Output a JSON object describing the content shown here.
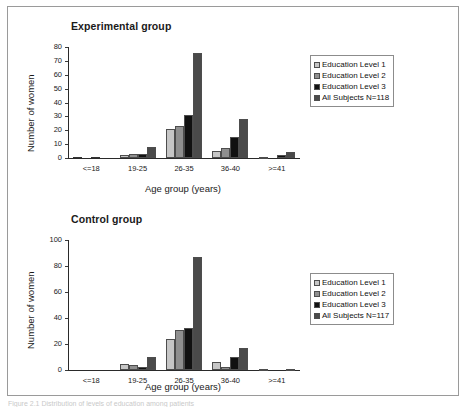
{
  "figure": {
    "caption": "Figure 2.1 Distribution of levels of education among patients"
  },
  "legend_items": [
    {
      "label": "Education Level 1",
      "color": "#c6c6c6"
    },
    {
      "label": "Education Level 2",
      "color": "#8f8f8f"
    },
    {
      "label": "Education Level 3",
      "color": "#111111"
    },
    {
      "label_exp": "All Subjects N=118",
      "label_ctl": "All Subjects N=117",
      "color": "#4a4a4a"
    }
  ],
  "chart_data": [
    {
      "type": "bar",
      "title": "Experimental group",
      "xlabel": "Age group (years)",
      "ylabel": "Number of women",
      "categories": [
        "<=18",
        "19-25",
        "26-35",
        "36-40",
        ">=41"
      ],
      "ylim": [
        0,
        80
      ],
      "yticks": [
        0,
        10,
        20,
        30,
        40,
        50,
        60,
        70,
        80
      ],
      "grid": false,
      "legend_position": "right",
      "series": [
        {
          "name": "Education Level 1",
          "color": "#c6c6c6",
          "values": [
            0,
            2,
            21,
            5,
            1
          ]
        },
        {
          "name": "Education Level 2",
          "color": "#8f8f8f",
          "values": [
            0,
            3,
            23,
            7,
            0
          ]
        },
        {
          "name": "Education Level 3",
          "color": "#111111",
          "values": [
            0,
            3,
            31,
            15,
            2
          ]
        },
        {
          "name": "All Subjects N=118",
          "color": "#4a4a4a",
          "values": [
            0,
            8,
            76,
            28,
            4
          ]
        }
      ]
    },
    {
      "type": "bar",
      "title": "Control group",
      "xlabel": "Age group (years)",
      "ylabel": "Number of women",
      "categories": [
        "<=18",
        "19-25",
        "26-35",
        "36-40",
        ">=41"
      ],
      "ylim": [
        0,
        100
      ],
      "yticks": [
        0,
        20,
        40,
        60,
        80,
        100
      ],
      "grid": false,
      "legend_position": "right",
      "series": [
        {
          "name": "Education Level 1",
          "color": "#c6c6c6",
          "values": [
            0,
            5,
            24,
            6,
            1
          ]
        },
        {
          "name": "Education Level 2",
          "color": "#8f8f8f",
          "values": [
            0,
            4,
            31,
            2,
            0
          ]
        },
        {
          "name": "Education Level 3",
          "color": "#111111",
          "values": [
            0,
            2,
            32,
            10,
            0
          ]
        },
        {
          "name": "All Subjects N=117",
          "color": "#4a4a4a",
          "values": [
            0,
            10,
            87,
            17,
            1
          ]
        }
      ]
    }
  ]
}
